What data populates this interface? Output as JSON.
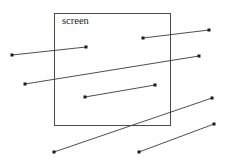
{
  "canvas": {
    "width": 227,
    "height": 168,
    "background_color": "#ffffff"
  },
  "diagram": {
    "title": "screen",
    "line_color": "#3a3a3a",
    "rect_color": "#4a4a4a",
    "endpoint_color": "#1a1a1a"
  },
  "screen": {
    "label": "screen",
    "label_x": 62,
    "label_y": 24,
    "x": 54,
    "y": 13,
    "width": 116,
    "height": 112
  },
  "segments": [
    {
      "name": "segment-1",
      "x1": 143,
      "y1": 38,
      "x2": 209,
      "y2": 30,
      "endpoints": [
        "start",
        "end"
      ]
    },
    {
      "name": "segment-2",
      "x1": 12,
      "y1": 55,
      "x2": 86,
      "y2": 47,
      "endpoints": [
        "start",
        "end"
      ]
    },
    {
      "name": "segment-3",
      "x1": 25,
      "y1": 84,
      "x2": 199,
      "y2": 56,
      "endpoints": [
        "start",
        "end"
      ]
    },
    {
      "name": "segment-4",
      "x1": 85,
      "y1": 97,
      "x2": 155,
      "y2": 85,
      "endpoints": [
        "start",
        "end"
      ]
    },
    {
      "name": "segment-5",
      "x1": 54,
      "y1": 152,
      "x2": 212,
      "y2": 98,
      "endpoints": [
        "start",
        "end"
      ]
    },
    {
      "name": "segment-6",
      "x1": 139,
      "y1": 152,
      "x2": 214,
      "y2": 124,
      "endpoints": [
        "start",
        "end"
      ]
    }
  ]
}
